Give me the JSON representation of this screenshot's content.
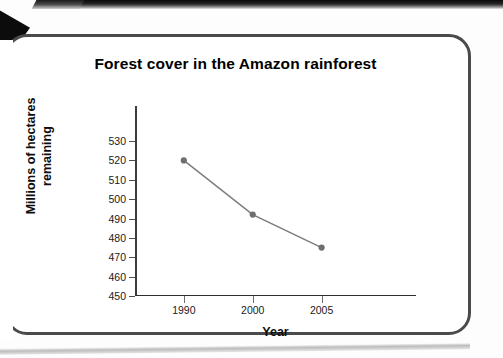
{
  "chart_data": {
    "type": "line",
    "title": "Forest cover in the Amazon rainforest",
    "xlabel": "Year",
    "ylabel_lines": [
      "Millions of hectares",
      "remaining"
    ],
    "ylabel": "Millions of hectares remaining",
    "categories": [
      "1990",
      "2000",
      "2005"
    ],
    "values": [
      520,
      492,
      475
    ],
    "series": [
      {
        "name": "Forest cover",
        "values": [
          520,
          492,
          475
        ]
      }
    ],
    "ylim": [
      450,
      530
    ],
    "y_ticks": [
      530,
      520,
      510,
      500,
      490,
      480,
      470,
      460,
      450
    ],
    "grid": false,
    "legend": "none",
    "line_color": "#7d7d7d",
    "marker_color": "#6e6e6e",
    "axis_color": "#2e2e2e",
    "text_color": "#0d0d0d"
  },
  "page": {
    "background_color": "#ffffff",
    "frame_color": "#4a4a4c"
  }
}
